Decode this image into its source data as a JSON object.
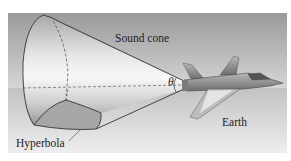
{
  "figure": {
    "labels": {
      "sound_cone": "Sound cone",
      "theta": "θ",
      "hyperbola": "Hyperbola",
      "earth": "Earth"
    },
    "colors": {
      "sky_top": "#9a9a9a",
      "sky_bottom": "#d4d4d4",
      "ground_top": "#c4c4c4",
      "ground_bottom": "#ececec",
      "cone_light": "#f4f4f4",
      "cone_dark": "#9c9c9c",
      "hyperbola_fill": "#a8a8a8",
      "outline": "#333333",
      "jet_body": "#8e8e8e",
      "jet_highlight": "#e0e0e0"
    }
  }
}
